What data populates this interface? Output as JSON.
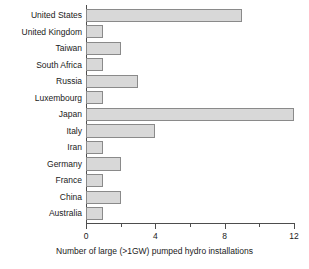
{
  "chart_data": {
    "type": "bar",
    "orientation": "horizontal",
    "title": "",
    "xlabel": "Number of large (>1GW) pumped hydro installations",
    "ylabel": "",
    "categories": [
      "United States",
      "United Kingdom",
      "Taiwan",
      "South Africa",
      "Russia",
      "Luxembourg",
      "Japan",
      "Italy",
      "Iran",
      "Germany",
      "France",
      "China",
      "Australia"
    ],
    "values": [
      9,
      1,
      2,
      1,
      3,
      1,
      12,
      4,
      1,
      2,
      1,
      2,
      1
    ],
    "xlim": [
      0,
      12
    ],
    "xticks": [
      0,
      4,
      8,
      12
    ],
    "xtick_labels": [
      "0",
      "4",
      "8",
      "12"
    ],
    "xticks_minor": [
      2,
      6,
      10
    ],
    "grid": false,
    "legend": null,
    "bar_fill_color": "#d8d8d8",
    "bar_edge_color": "#8a8a8a",
    "axis_color": "#4d4d4d",
    "background_color": "#ffffff"
  }
}
